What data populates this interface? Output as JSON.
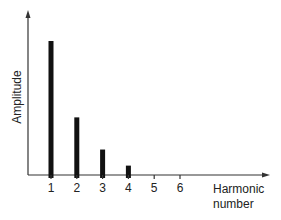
{
  "chart_data": {
    "type": "bar",
    "title": "",
    "xlabel": "Harmonic number",
    "xlabel_lines": [
      "Harmonic",
      "number"
    ],
    "ylabel": "Amplitude",
    "categories": [
      "1",
      "2",
      "3",
      "4",
      "5",
      "6"
    ],
    "values": [
      1.0,
      0.43,
      0.19,
      0.07,
      0,
      0
    ],
    "ylim": [
      0,
      1.1
    ],
    "grid": false,
    "legend": null,
    "y_ticks": false,
    "bar_color": "#111111",
    "axis_color": "#333333"
  }
}
